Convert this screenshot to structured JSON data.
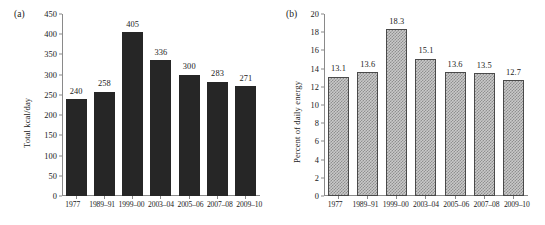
{
  "figure": {
    "panel_a_tag": "(a)",
    "panel_b_tag": "(b)"
  },
  "chart_data": [
    {
      "type": "bar",
      "panel": "(a)",
      "title": "",
      "xlabel": "",
      "ylabel": "Total kcal/day",
      "categories": [
        "1977",
        "1989–91",
        "1999–00",
        "2003–04",
        "2005–06",
        "2007–08",
        "2009–10"
      ],
      "values": [
        240,
        258,
        405,
        336,
        300,
        283,
        271
      ],
      "value_labels": [
        "240",
        "258",
        "405",
        "336",
        "300",
        "283",
        "271"
      ],
      "ylim": [
        0,
        450
      ],
      "ytick_values": [
        0,
        50,
        100,
        150,
        200,
        250,
        300,
        350,
        400,
        450
      ],
      "ytick_labels": [
        "0",
        "50",
        "100",
        "150",
        "200",
        "250",
        "300",
        "350",
        "400",
        "450"
      ],
      "grid": false,
      "legend": false,
      "bar_style": "solid-black",
      "bar_color": "#262626"
    },
    {
      "type": "bar",
      "panel": "(b)",
      "title": "",
      "xlabel": "",
      "ylabel": "Percent of daily energy",
      "categories": [
        "1977",
        "1989–91",
        "1999–00",
        "2003–04",
        "2005–06",
        "2007–08",
        "2009–10"
      ],
      "values": [
        13.1,
        13.6,
        18.3,
        15.1,
        13.6,
        13.5,
        12.7
      ],
      "value_labels": [
        "13.1",
        "13.6",
        "18.3",
        "15.1",
        "13.6",
        "13.5",
        "12.7"
      ],
      "ylim": [
        0,
        20
      ],
      "ytick_values": [
        0,
        2,
        4,
        6,
        8,
        10,
        12,
        14,
        16,
        18,
        20
      ],
      "ytick_labels": [
        "0",
        "2",
        "4",
        "6",
        "8",
        "10",
        "12",
        "14",
        "16",
        "18",
        "20"
      ],
      "grid": false,
      "legend": false,
      "bar_style": "dotted-gray",
      "bar_color": "#c9c9c9"
    }
  ]
}
